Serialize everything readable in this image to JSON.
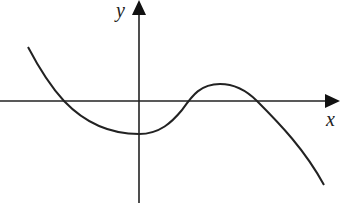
{
  "figure": {
    "type": "function-graph",
    "axes": {
      "x_label": "x",
      "y_label": "y",
      "color": "#222222"
    },
    "curve": {
      "color": "#222222",
      "description": "Cubic-like curve: decreasing from upper left, crossing x-axis, minimum at y-axis below origin, rising to a local maximum above x-axis, then decreasing steeply",
      "x_intercepts_count": 3,
      "local_min": "on y-axis, below x-axis",
      "local_max": "right of y-axis, above x-axis"
    }
  }
}
